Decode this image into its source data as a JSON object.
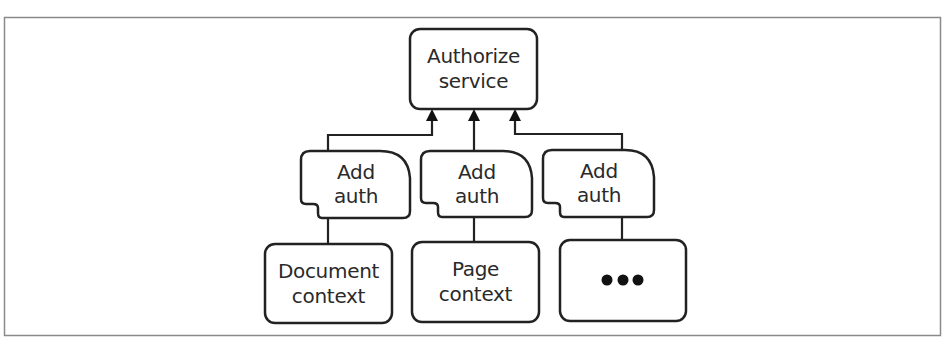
{
  "diagram": {
    "type": "tree",
    "direction": "bottom-to-top",
    "root": {
      "id": "authorize-service",
      "lines": [
        "Authorize",
        "service"
      ]
    },
    "middlewares": [
      {
        "id": "add-auth-1",
        "lines": [
          "Add",
          "auth"
        ]
      },
      {
        "id": "add-auth-2",
        "lines": [
          "Add",
          "auth"
        ]
      },
      {
        "id": "add-auth-3",
        "lines": [
          "Add",
          "auth"
        ]
      }
    ],
    "contexts": [
      {
        "id": "document-context",
        "lines": [
          "Document",
          "context"
        ]
      },
      {
        "id": "page-context",
        "lines": [
          "Page",
          "context"
        ]
      },
      {
        "id": "more-contexts",
        "lines": [],
        "ellipsis": true
      }
    ],
    "edges": [
      {
        "from": "document-context",
        "to": "add-auth-1"
      },
      {
        "from": "page-context",
        "to": "add-auth-2"
      },
      {
        "from": "more-contexts",
        "to": "add-auth-3"
      },
      {
        "from": "add-auth-1",
        "to": "authorize-service",
        "arrow": true
      },
      {
        "from": "add-auth-2",
        "to": "authorize-service",
        "arrow": true
      },
      {
        "from": "add-auth-3",
        "to": "authorize-service",
        "arrow": true
      }
    ],
    "colors": {
      "stroke": "#222222",
      "frame": "#8a8a8a",
      "background": "#ffffff"
    }
  }
}
